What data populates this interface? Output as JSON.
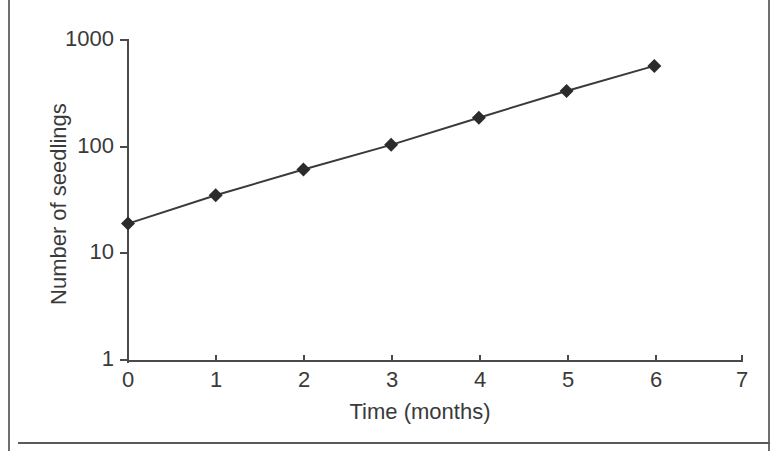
{
  "chart_data": {
    "type": "line",
    "title": "",
    "xlabel": "Time (months)",
    "ylabel": "Number of seedlings",
    "x": [
      0,
      1,
      2,
      3,
      4,
      5,
      6
    ],
    "values": [
      19,
      35,
      61,
      104,
      187,
      333,
      572
    ],
    "series": [
      {
        "name": "Number of seedlings",
        "values": [
          19,
          35,
          61,
          104,
          187,
          333,
          572
        ]
      }
    ],
    "xlim": [
      0,
      7
    ],
    "ylim": [
      1,
      1000
    ],
    "yscale": "log",
    "xscale": "linear",
    "x_ticks": [
      "0",
      "1",
      "2",
      "3",
      "4",
      "5",
      "6",
      "7"
    ],
    "y_ticks": [
      "1",
      "10",
      "100",
      "1000"
    ],
    "grid": false,
    "legend": false,
    "legend_position": "none",
    "marker": "diamond",
    "line_color": "#3a3a3a",
    "marker_color": "#2b2b2b",
    "axis_color": "#4a4a4a",
    "background_color": "#ffffff",
    "annotations": []
  },
  "figure": {
    "border_color": "#6e6e6e",
    "rule_color": "#5a5a5a"
  }
}
